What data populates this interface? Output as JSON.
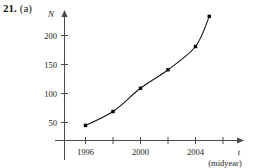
{
  "problem": {
    "number": "21.",
    "part": "(a)"
  },
  "chart_data": {
    "type": "scatter",
    "title": "",
    "subtitle": "",
    "xlabel": "t",
    "xlabel_unit": "(midyear)",
    "ylabel": "N",
    "x": [
      1996,
      1998,
      2000,
      2002,
      2004,
      2005
    ],
    "values": [
      45,
      69,
      109,
      141,
      181,
      233
    ],
    "series": [
      {
        "name": "N",
        "values": [
          45,
          69,
          109,
          141,
          181,
          233
        ]
      }
    ],
    "xticks": [
      1996,
      1997,
      1998,
      1999,
      2000,
      2001,
      2002,
      2003,
      2004,
      2005
    ],
    "xtick_labels": [
      "1996",
      "",
      "",
      "",
      "2000",
      "",
      "",
      "",
      "2004",
      ""
    ],
    "yticks": [
      50,
      100,
      150,
      200
    ],
    "ytick_labels": [
      "50",
      "100",
      "150",
      "200"
    ],
    "xlim": [
      1995,
      2006
    ],
    "ylim": [
      0,
      245
    ],
    "grid": false,
    "legend": "none",
    "marker": "filled-square",
    "connected": true,
    "curve": "smooth"
  },
  "colors": {
    "axis": "#4a4a4a",
    "curve": "#151515",
    "marker": "#000000",
    "text": "#1a1a1a",
    "background": "#ffffff"
  }
}
